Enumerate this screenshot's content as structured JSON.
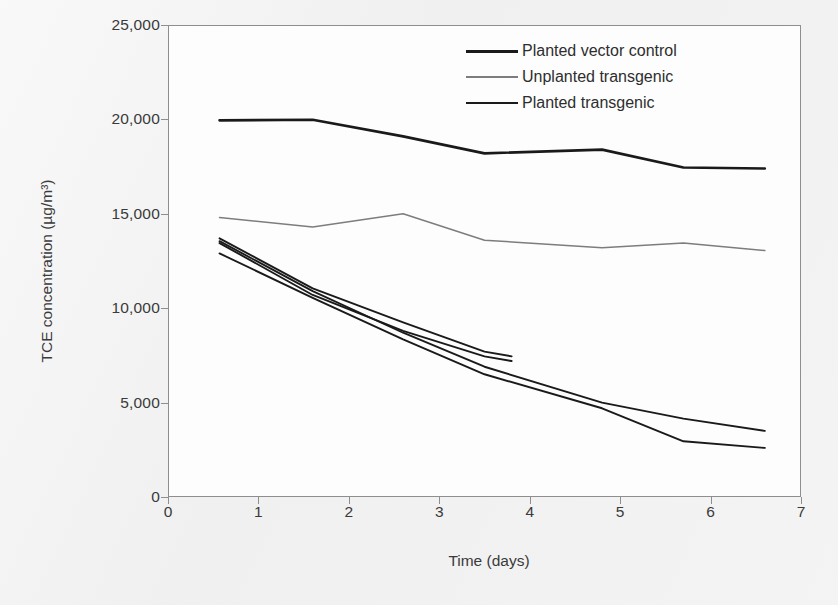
{
  "chart_data": {
    "type": "line",
    "title": "",
    "xlabel": "Time (days)",
    "ylabel": "TCE concentration (µg/m³)",
    "xlim": [
      0,
      7
    ],
    "ylim": [
      0,
      25000
    ],
    "xticks": [
      "0",
      "1",
      "2",
      "3",
      "4",
      "5",
      "6",
      "7"
    ],
    "yticks": [
      "0",
      "5,000",
      "10,000",
      "15,000",
      "20,000",
      "25,000"
    ],
    "ytick_values": [
      0,
      5000,
      10000,
      15000,
      20000,
      25000
    ],
    "xtick_values": [
      0,
      1,
      2,
      3,
      4,
      5,
      6,
      7
    ],
    "grid": false,
    "legend_position": "top-right-inside",
    "series": [
      {
        "name": "Planted vector control",
        "color": "#1a1a1a",
        "width": 2.6,
        "x": [
          0.57,
          1.6,
          2.6,
          3.5,
          4.8,
          5.7,
          6.6
        ],
        "values": [
          19950,
          19980,
          19100,
          18200,
          18400,
          17450,
          17400
        ]
      },
      {
        "name": "Unplanted transgenic",
        "color": "#7d7d7d",
        "width": 1.5,
        "x": [
          0.57,
          1.6,
          2.6,
          3.5,
          4.8,
          5.7,
          6.6
        ],
        "values": [
          14800,
          14300,
          15000,
          13600,
          13200,
          13450,
          13050
        ]
      },
      {
        "name": "Planted transgenic",
        "color": "#1a1a1a",
        "width": 1.9,
        "replicates": [
          {
            "label": "planted-transgenic-rep-1",
            "x": [
              0.57,
              1.6,
              2.6,
              3.5,
              3.8
            ],
            "values": [
              13700,
              11050,
              9250,
              7700,
              7450
            ]
          },
          {
            "label": "planted-transgenic-rep-2",
            "x": [
              0.57,
              1.6,
              2.6,
              3.5,
              3.8
            ],
            "values": [
              13450,
              10700,
              8800,
              7450,
              7200
            ]
          },
          {
            "label": "planted-transgenic-rep-3",
            "x": [
              0.57,
              1.6,
              2.6,
              3.5,
              4.8,
              5.7,
              6.6
            ],
            "values": [
              13550,
              10900,
              8700,
              6900,
              5000,
              4150,
              3500
            ]
          },
          {
            "label": "planted-transgenic-rep-4",
            "x": [
              0.57,
              1.6,
              2.6,
              3.5,
              4.8,
              5.7,
              6.6
            ],
            "values": [
              12900,
              10550,
              8350,
              6500,
              4700,
              2950,
              2600
            ]
          }
        ]
      }
    ],
    "legend": [
      "Planted vector control",
      "Unplanted transgenic",
      "Planted transgenic"
    ]
  },
  "colors": {
    "page_background": "#f1f1f1",
    "plot_background": "#fdfdfd",
    "axis": "#8e8e8e",
    "text": "#3a3a3a",
    "series_dark": "#1a1a1a",
    "series_gray": "#7d7d7d"
  }
}
